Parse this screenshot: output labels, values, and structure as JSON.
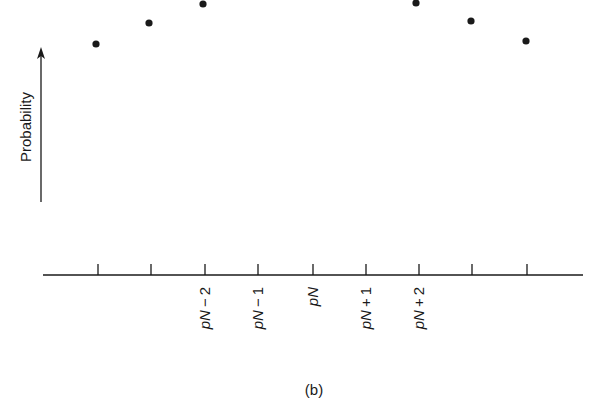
{
  "chart_data": {
    "type": "scatter",
    "title": "",
    "caption": "(b)",
    "xlabel": "",
    "ylabel": "Probability",
    "ylabel_arrow": true,
    "grid": false,
    "legend": null,
    "x_ticks": [
      {
        "pos": 98,
        "label": ""
      },
      {
        "pos": 151,
        "label": ""
      },
      {
        "pos": 205,
        "label": "pN − 2"
      },
      {
        "pos": 258,
        "label": "pN − 1"
      },
      {
        "pos": 313,
        "label": "pN"
      },
      {
        "pos": 366,
        "label": "pN + 1"
      },
      {
        "pos": 419,
        "label": "pN + 2"
      },
      {
        "pos": 472,
        "label": ""
      },
      {
        "pos": 527,
        "label": ""
      }
    ],
    "points": [
      {
        "x": 96,
        "y": 44
      },
      {
        "x": 149,
        "y": 23
      },
      {
        "x": 203,
        "y": 4
      },
      {
        "x": 416,
        "y": 3
      },
      {
        "x": 471,
        "y": 21
      },
      {
        "x": 526,
        "y": 41
      }
    ],
    "axis": {
      "x_start": 43,
      "x_end": 583,
      "y": 275,
      "tick_height": 11
    },
    "y_arrow": {
      "x": 41,
      "y_bottom": 202,
      "y_top": 47
    },
    "colors": {
      "ink": "#1a1a1a",
      "background": "#ffffff"
    }
  }
}
